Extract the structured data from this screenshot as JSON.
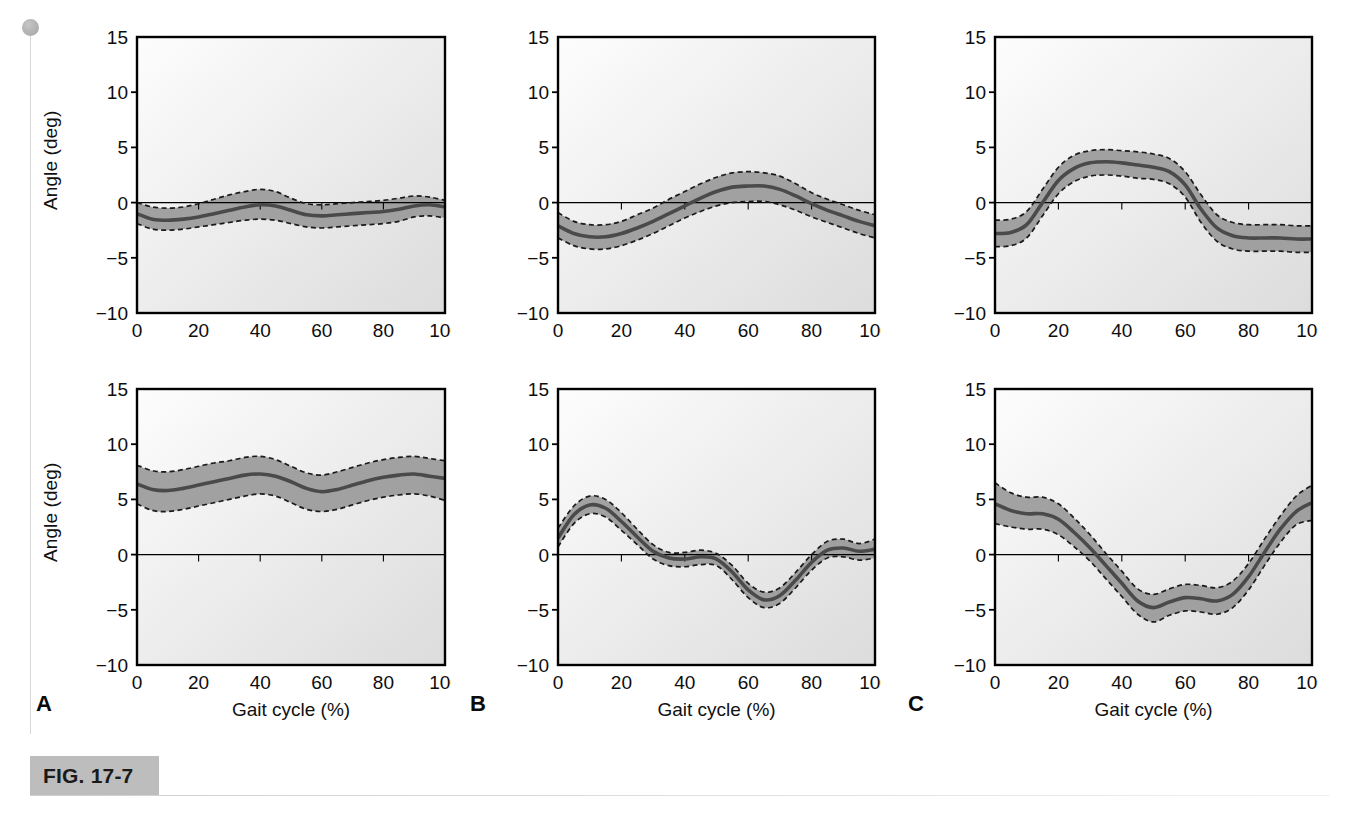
{
  "figure": {
    "tag": "FIG. 17-7",
    "axis_label_y": "Angle (deg)",
    "axis_label_x": "Gait cycle (%)",
    "panel_letters": [
      "A",
      "B",
      "C"
    ],
    "colors": {
      "band_fill": "#9a9a9a",
      "mean_line": "#4a4a4a",
      "band_edge": "#1a1a1a",
      "frame": "#000000",
      "plot_bg_light": "#fbfbfb",
      "plot_bg_dark": "#dcdcdc",
      "fig_tag_bg": "#bdbdbd"
    }
  },
  "chart_data": [
    {
      "id": "panel-a-top",
      "type": "line",
      "title": "",
      "xlabel": "Gait cycle (%)",
      "ylabel": "Angle (deg)",
      "xlim": [
        0,
        100
      ],
      "ylim": [
        -10,
        15
      ],
      "yticks": [
        -10,
        -5,
        0,
        5,
        10,
        15
      ],
      "xticks": [
        0,
        20,
        40,
        60,
        80,
        100
      ],
      "grid": false,
      "zero_line": true,
      "x": [
        0,
        5,
        10,
        15,
        20,
        25,
        30,
        35,
        40,
        45,
        50,
        55,
        60,
        65,
        70,
        75,
        80,
        85,
        90,
        95,
        100
      ],
      "series": [
        {
          "name": "mean",
          "values": [
            -1.0,
            -1.5,
            -1.6,
            -1.5,
            -1.3,
            -1.0,
            -0.7,
            -0.4,
            -0.2,
            -0.3,
            -0.7,
            -1.1,
            -1.2,
            -1.1,
            -1.0,
            -0.9,
            -0.8,
            -0.6,
            -0.3,
            -0.2,
            -0.4
          ]
        },
        {
          "name": "upper_sd",
          "values": [
            0.0,
            -0.4,
            -0.5,
            -0.4,
            -0.1,
            0.3,
            0.7,
            1.0,
            1.2,
            1.0,
            0.4,
            -0.1,
            -0.2,
            -0.1,
            0.0,
            0.1,
            0.2,
            0.4,
            0.6,
            0.5,
            0.2
          ]
        },
        {
          "name": "lower_sd",
          "values": [
            -1.9,
            -2.4,
            -2.5,
            -2.4,
            -2.2,
            -2.0,
            -1.8,
            -1.6,
            -1.5,
            -1.6,
            -1.9,
            -2.2,
            -2.3,
            -2.2,
            -2.1,
            -2.0,
            -1.9,
            -1.7,
            -1.3,
            -1.2,
            -1.4
          ]
        }
      ]
    },
    {
      "id": "panel-b-top",
      "type": "line",
      "title": "",
      "xlabel": "Gait cycle (%)",
      "ylabel": "",
      "xlim": [
        0,
        100
      ],
      "ylim": [
        -10,
        15
      ],
      "yticks": [
        -10,
        -5,
        0,
        5,
        10,
        15
      ],
      "xticks": [
        0,
        20,
        40,
        60,
        80,
        100
      ],
      "grid": false,
      "zero_line": true,
      "x": [
        0,
        5,
        10,
        15,
        20,
        25,
        30,
        35,
        40,
        45,
        50,
        55,
        60,
        65,
        70,
        75,
        80,
        85,
        90,
        95,
        100
      ],
      "series": [
        {
          "name": "mean",
          "values": [
            -2.1,
            -2.8,
            -3.1,
            -3.1,
            -2.8,
            -2.3,
            -1.7,
            -1.0,
            -0.3,
            0.4,
            1.0,
            1.4,
            1.5,
            1.5,
            1.2,
            0.6,
            -0.1,
            -0.7,
            -1.2,
            -1.7,
            -2.1
          ]
        },
        {
          "name": "upper_sd",
          "values": [
            -0.9,
            -1.7,
            -2.0,
            -2.0,
            -1.7,
            -1.1,
            -0.5,
            0.3,
            1.0,
            1.7,
            2.3,
            2.7,
            2.8,
            2.7,
            2.4,
            1.7,
            0.9,
            0.3,
            -0.2,
            -0.7,
            -1.1
          ]
        },
        {
          "name": "lower_sd",
          "values": [
            -3.2,
            -3.9,
            -4.2,
            -4.2,
            -3.9,
            -3.4,
            -2.8,
            -2.1,
            -1.4,
            -0.8,
            -0.3,
            0.0,
            0.1,
            0.1,
            -0.2,
            -0.7,
            -1.3,
            -1.8,
            -2.3,
            -2.8,
            -3.2
          ]
        }
      ]
    },
    {
      "id": "panel-c-top",
      "type": "line",
      "title": "",
      "xlabel": "Gait cycle (%)",
      "ylabel": "",
      "xlim": [
        0,
        100
      ],
      "ylim": [
        -10,
        15
      ],
      "yticks": [
        -10,
        -5,
        0,
        5,
        10,
        15
      ],
      "xticks": [
        0,
        20,
        40,
        60,
        80,
        100
      ],
      "grid": false,
      "zero_line": true,
      "x": [
        0,
        5,
        10,
        15,
        20,
        25,
        30,
        35,
        40,
        45,
        50,
        55,
        60,
        65,
        70,
        75,
        80,
        85,
        90,
        95,
        100
      ],
      "series": [
        {
          "name": "mean",
          "values": [
            -2.8,
            -2.7,
            -2.0,
            0.0,
            2.0,
            3.1,
            3.6,
            3.7,
            3.6,
            3.4,
            3.2,
            2.8,
            1.6,
            -0.6,
            -2.3,
            -3.0,
            -3.2,
            -3.2,
            -3.2,
            -3.3,
            -3.3
          ]
        },
        {
          "name": "upper_sd",
          "values": [
            -1.6,
            -1.5,
            -0.8,
            1.2,
            3.2,
            4.3,
            4.7,
            4.8,
            4.7,
            4.6,
            4.4,
            4.0,
            2.8,
            0.7,
            -1.1,
            -1.8,
            -2.0,
            -2.0,
            -2.0,
            -2.1,
            -2.1
          ]
        },
        {
          "name": "lower_sd",
          "values": [
            -4.0,
            -3.9,
            -3.2,
            -1.2,
            0.8,
            1.9,
            2.4,
            2.5,
            2.4,
            2.2,
            2.1,
            1.7,
            0.5,
            -1.8,
            -3.5,
            -4.2,
            -4.4,
            -4.4,
            -4.4,
            -4.5,
            -4.5
          ]
        }
      ]
    },
    {
      "id": "panel-a-bottom",
      "type": "line",
      "title": "",
      "xlabel": "Gait cycle (%)",
      "ylabel": "Angle (deg)",
      "xlim": [
        0,
        100
      ],
      "ylim": [
        -10,
        15
      ],
      "yticks": [
        -10,
        -5,
        0,
        5,
        10,
        15
      ],
      "xticks": [
        0,
        20,
        40,
        60,
        80,
        100
      ],
      "grid": false,
      "zero_line": true,
      "x": [
        0,
        5,
        10,
        15,
        20,
        25,
        30,
        35,
        40,
        45,
        50,
        55,
        60,
        65,
        70,
        75,
        80,
        85,
        90,
        95,
        100
      ],
      "series": [
        {
          "name": "mean",
          "values": [
            6.4,
            5.9,
            5.8,
            6.0,
            6.3,
            6.6,
            6.9,
            7.2,
            7.3,
            7.1,
            6.6,
            6.0,
            5.7,
            5.9,
            6.3,
            6.7,
            7.0,
            7.2,
            7.3,
            7.1,
            6.9
          ]
        },
        {
          "name": "upper_sd",
          "values": [
            8.1,
            7.6,
            7.5,
            7.7,
            8.0,
            8.3,
            8.5,
            8.8,
            8.9,
            8.6,
            8.0,
            7.4,
            7.2,
            7.5,
            7.9,
            8.3,
            8.6,
            8.8,
            8.9,
            8.7,
            8.5
          ]
        },
        {
          "name": "lower_sd",
          "values": [
            4.6,
            4.0,
            3.9,
            4.1,
            4.4,
            4.7,
            5.0,
            5.3,
            5.5,
            5.3,
            4.7,
            4.1,
            3.9,
            4.1,
            4.5,
            4.9,
            5.2,
            5.4,
            5.5,
            5.3,
            4.9
          ]
        }
      ]
    },
    {
      "id": "panel-b-bottom",
      "type": "line",
      "title": "",
      "xlabel": "Gait cycle (%)",
      "ylabel": "",
      "xlim": [
        0,
        100
      ],
      "ylim": [
        -10,
        15
      ],
      "yticks": [
        -10,
        -5,
        0,
        5,
        10,
        15
      ],
      "xticks": [
        0,
        20,
        40,
        60,
        80,
        100
      ],
      "grid": false,
      "zero_line": true,
      "x": [
        0,
        5,
        10,
        15,
        20,
        25,
        30,
        35,
        40,
        45,
        50,
        55,
        60,
        65,
        70,
        75,
        80,
        85,
        90,
        95,
        100
      ],
      "series": [
        {
          "name": "mean",
          "values": [
            1.5,
            3.6,
            4.5,
            4.2,
            3.0,
            1.6,
            0.3,
            -0.3,
            -0.4,
            -0.2,
            -0.4,
            -1.6,
            -3.2,
            -4.1,
            -3.7,
            -2.3,
            -0.7,
            0.4,
            0.6,
            0.3,
            0.5
          ]
        },
        {
          "name": "upper_sd",
          "values": [
            2.4,
            4.4,
            5.3,
            5.0,
            3.8,
            2.3,
            0.9,
            0.2,
            0.2,
            0.4,
            0.1,
            -1.0,
            -2.6,
            -3.4,
            -3.0,
            -1.6,
            0.0,
            1.2,
            1.4,
            1.0,
            1.4
          ]
        },
        {
          "name": "lower_sd",
          "values": [
            0.7,
            2.8,
            3.7,
            3.4,
            2.2,
            0.9,
            -0.4,
            -1.0,
            -1.1,
            -0.9,
            -1.0,
            -2.3,
            -3.9,
            -4.8,
            -4.4,
            -3.0,
            -1.4,
            -0.3,
            -0.2,
            -0.5,
            -0.3
          ]
        }
      ]
    },
    {
      "id": "panel-c-bottom",
      "type": "line",
      "title": "",
      "xlabel": "Gait cycle (%)",
      "ylabel": "",
      "xlim": [
        0,
        100
      ],
      "ylim": [
        -10,
        15
      ],
      "yticks": [
        -10,
        -5,
        0,
        5,
        10,
        15
      ],
      "xticks": [
        0,
        20,
        40,
        60,
        80,
        100
      ],
      "grid": false,
      "zero_line": true,
      "x": [
        0,
        5,
        10,
        15,
        20,
        25,
        30,
        35,
        40,
        45,
        50,
        55,
        60,
        65,
        70,
        75,
        80,
        85,
        90,
        95,
        100
      ],
      "series": [
        {
          "name": "mean",
          "values": [
            4.6,
            4.0,
            3.7,
            3.7,
            3.2,
            2.0,
            0.6,
            -1.0,
            -2.6,
            -4.2,
            -4.8,
            -4.3,
            -3.9,
            -4.0,
            -4.2,
            -3.6,
            -2.0,
            0.2,
            2.3,
            3.9,
            4.7
          ]
        },
        {
          "name": "upper_sd",
          "values": [
            6.5,
            5.6,
            5.2,
            5.2,
            4.6,
            3.3,
            1.8,
            0.1,
            -1.5,
            -3.1,
            -3.6,
            -3.1,
            -2.7,
            -2.8,
            -3.0,
            -2.4,
            -0.8,
            1.4,
            3.5,
            5.3,
            6.3
          ]
        },
        {
          "name": "lower_sd",
          "values": [
            2.8,
            2.5,
            2.3,
            2.3,
            1.8,
            0.7,
            -0.6,
            -2.2,
            -3.8,
            -5.4,
            -6.1,
            -5.5,
            -5.1,
            -5.2,
            -5.4,
            -4.8,
            -3.2,
            -1.0,
            1.1,
            2.7,
            3.1
          ]
        }
      ]
    }
  ]
}
